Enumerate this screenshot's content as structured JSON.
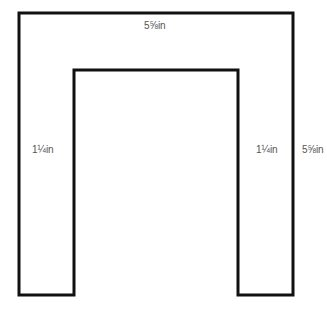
{
  "diagram": {
    "shape": "U-shaped (inverted) frame outline",
    "stroke_color": "#111111",
    "labels": {
      "top_width": "5⅝in",
      "left_leg_width": "1¼in",
      "right_leg_width": "1¼in",
      "right_height": "5⅝in"
    }
  }
}
